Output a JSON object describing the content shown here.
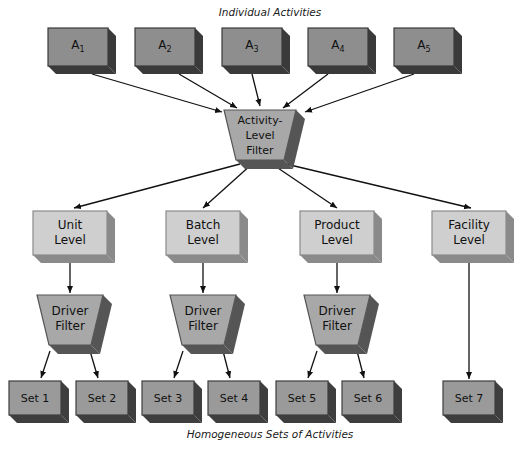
{
  "diagram": {
    "top_caption": "Individual Activities",
    "bottom_caption": "Homogeneous Sets of Activities",
    "colors": {
      "activity_face": "#8e8e8e",
      "activity_side": "#3a3a3a",
      "level_face": "#cfcfcf",
      "level_side": "#8a8a8a",
      "filter_face": "#a8a8a8",
      "filter_side": "#555555",
      "set_face": "#9a9a9a",
      "set_side": "#3e3e3e",
      "line": "#111111"
    },
    "activities": [
      {
        "label": "A",
        "sub": "1",
        "x": 78
      },
      {
        "label": "A",
        "sub": "2",
        "x": 165
      },
      {
        "label": "A",
        "sub": "3",
        "x": 252
      },
      {
        "label": "A",
        "sub": "4",
        "x": 338
      },
      {
        "label": "A",
        "sub": "5",
        "x": 424
      }
    ],
    "activity_filter": {
      "line1": "Activity-",
      "line2": "Level",
      "line3": "Filter"
    },
    "levels": [
      {
        "line1": "Unit",
        "line2": "Level",
        "x": 70
      },
      {
        "line1": "Batch",
        "line2": "Level",
        "x": 203
      },
      {
        "line1": "Product",
        "line2": "Level",
        "x": 337
      },
      {
        "line1": "Facility",
        "line2": "Level",
        "x": 469
      }
    ],
    "driver_filters": [
      {
        "line1": "Driver",
        "line2": "Filter",
        "x": 70
      },
      {
        "line1": "Driver",
        "line2": "Filter",
        "x": 203
      },
      {
        "line1": "Driver",
        "line2": "Filter",
        "x": 337
      }
    ],
    "sets": [
      {
        "label": "Set 1",
        "x": 35
      },
      {
        "label": "Set 2",
        "x": 102
      },
      {
        "label": "Set 3",
        "x": 168
      },
      {
        "label": "Set 4",
        "x": 234
      },
      {
        "label": "Set 5",
        "x": 302
      },
      {
        "label": "Set 6",
        "x": 368
      },
      {
        "label": "Set 7",
        "x": 469
      }
    ]
  }
}
